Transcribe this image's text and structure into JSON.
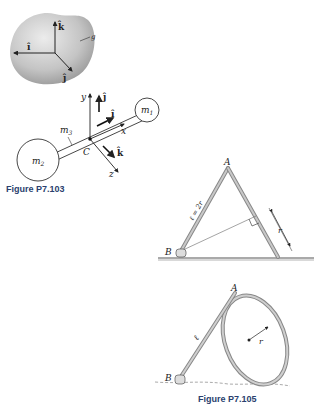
{
  "figure_103": {
    "caption": "Figure P7.103",
    "blob": {
      "unit_vectors": {
        "i": "î",
        "j": "ĵ",
        "k": "k̂"
      },
      "label": "g"
    },
    "dumbbell": {
      "axis_labels": {
        "x": "x",
        "y": "y",
        "z": "z"
      },
      "unit_vectors": {
        "i": "î",
        "j": "ĵ",
        "k": "k̂"
      },
      "point": "C",
      "masses": {
        "m1": "m",
        "m1_sub": "1",
        "m2": "m",
        "m2_sub": "2",
        "m3": "m",
        "m3_sub": "3"
      }
    }
  },
  "figure_104": {
    "points": {
      "A": "A",
      "B": "B"
    },
    "length_label": "ℓ = 2r",
    "dimension_label": "r"
  },
  "figure_105": {
    "caption": "Figure P7.105",
    "points": {
      "A": "A",
      "B": "B"
    },
    "length_label": "ℓ",
    "radius_label": "r"
  },
  "colors": {
    "caption": "#2a3f6e",
    "line": "#333333",
    "rod_fill": "#b0b0b0",
    "blob_light": "#e2e2e2",
    "blob_dark": "#9a9a9a"
  }
}
